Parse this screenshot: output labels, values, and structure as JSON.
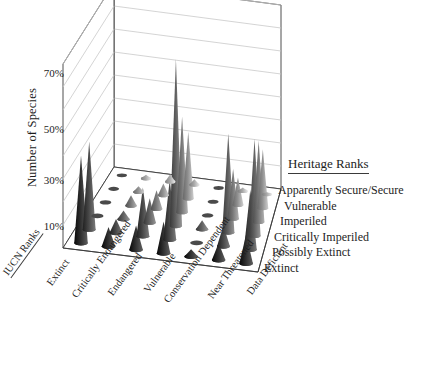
{
  "axes": {
    "y_title": "Number of Species",
    "y_ticks": [
      "70%",
      "50%",
      "30%",
      "10%"
    ],
    "y_tick_values": [
      70,
      50,
      30,
      10
    ],
    "x_axis_title": "IUCN Ranks",
    "x_categories": [
      "Extinct",
      "Critically Endangered",
      "Endangered",
      "Vulnerable",
      "Conservation Dependent",
      "Near Threatened",
      "Data Deficient"
    ]
  },
  "legend": {
    "title": "Heritage Ranks",
    "items": [
      "Apparently Secure/Secure",
      "Vulnerable",
      "Imperiled",
      "Critically Imperiled",
      "Possibly Extinct",
      "Extinct"
    ]
  },
  "chart_data": {
    "type": "bar",
    "render": "3d-cone",
    "title": "",
    "xlabel": "IUCN Ranks",
    "ylabel": "Number of Species",
    "zlabel": "Heritage Ranks",
    "ylim": [
      0,
      80
    ],
    "grid": true,
    "legend_position": "right",
    "categories": [
      "Extinct",
      "Critically Endangered",
      "Endangered",
      "Vulnerable",
      "Conservation Dependent",
      "Near Threatened",
      "Data Deficient"
    ],
    "series": [
      {
        "name": "Apparently Secure/Secure",
        "values": [
          0,
          2,
          4,
          3,
          0,
          2,
          1
        ]
      },
      {
        "name": "Vulnerable",
        "values": [
          0,
          3,
          6,
          34,
          0,
          14,
          30
        ]
      },
      {
        "name": "Imperiled",
        "values": [
          0,
          5,
          9,
          46,
          0,
          24,
          39
        ]
      },
      {
        "name": "Critically Imperiled",
        "values": [
          0,
          4,
          11,
          76,
          4,
          45,
          44
        ]
      },
      {
        "name": "Possibly Extinct",
        "values": [
          38,
          6,
          21,
          26,
          0,
          9,
          26
        ]
      },
      {
        "name": "Extinct",
        "values": [
          36,
          8,
          10,
          13,
          3,
          7,
          12
        ]
      }
    ]
  },
  "colors": {
    "axis": "#3a3a3a",
    "grid": "#c9c9c9",
    "text": "#1d1d1d",
    "cone_dark": "#111111",
    "cone_light": "#e2e2e2"
  }
}
